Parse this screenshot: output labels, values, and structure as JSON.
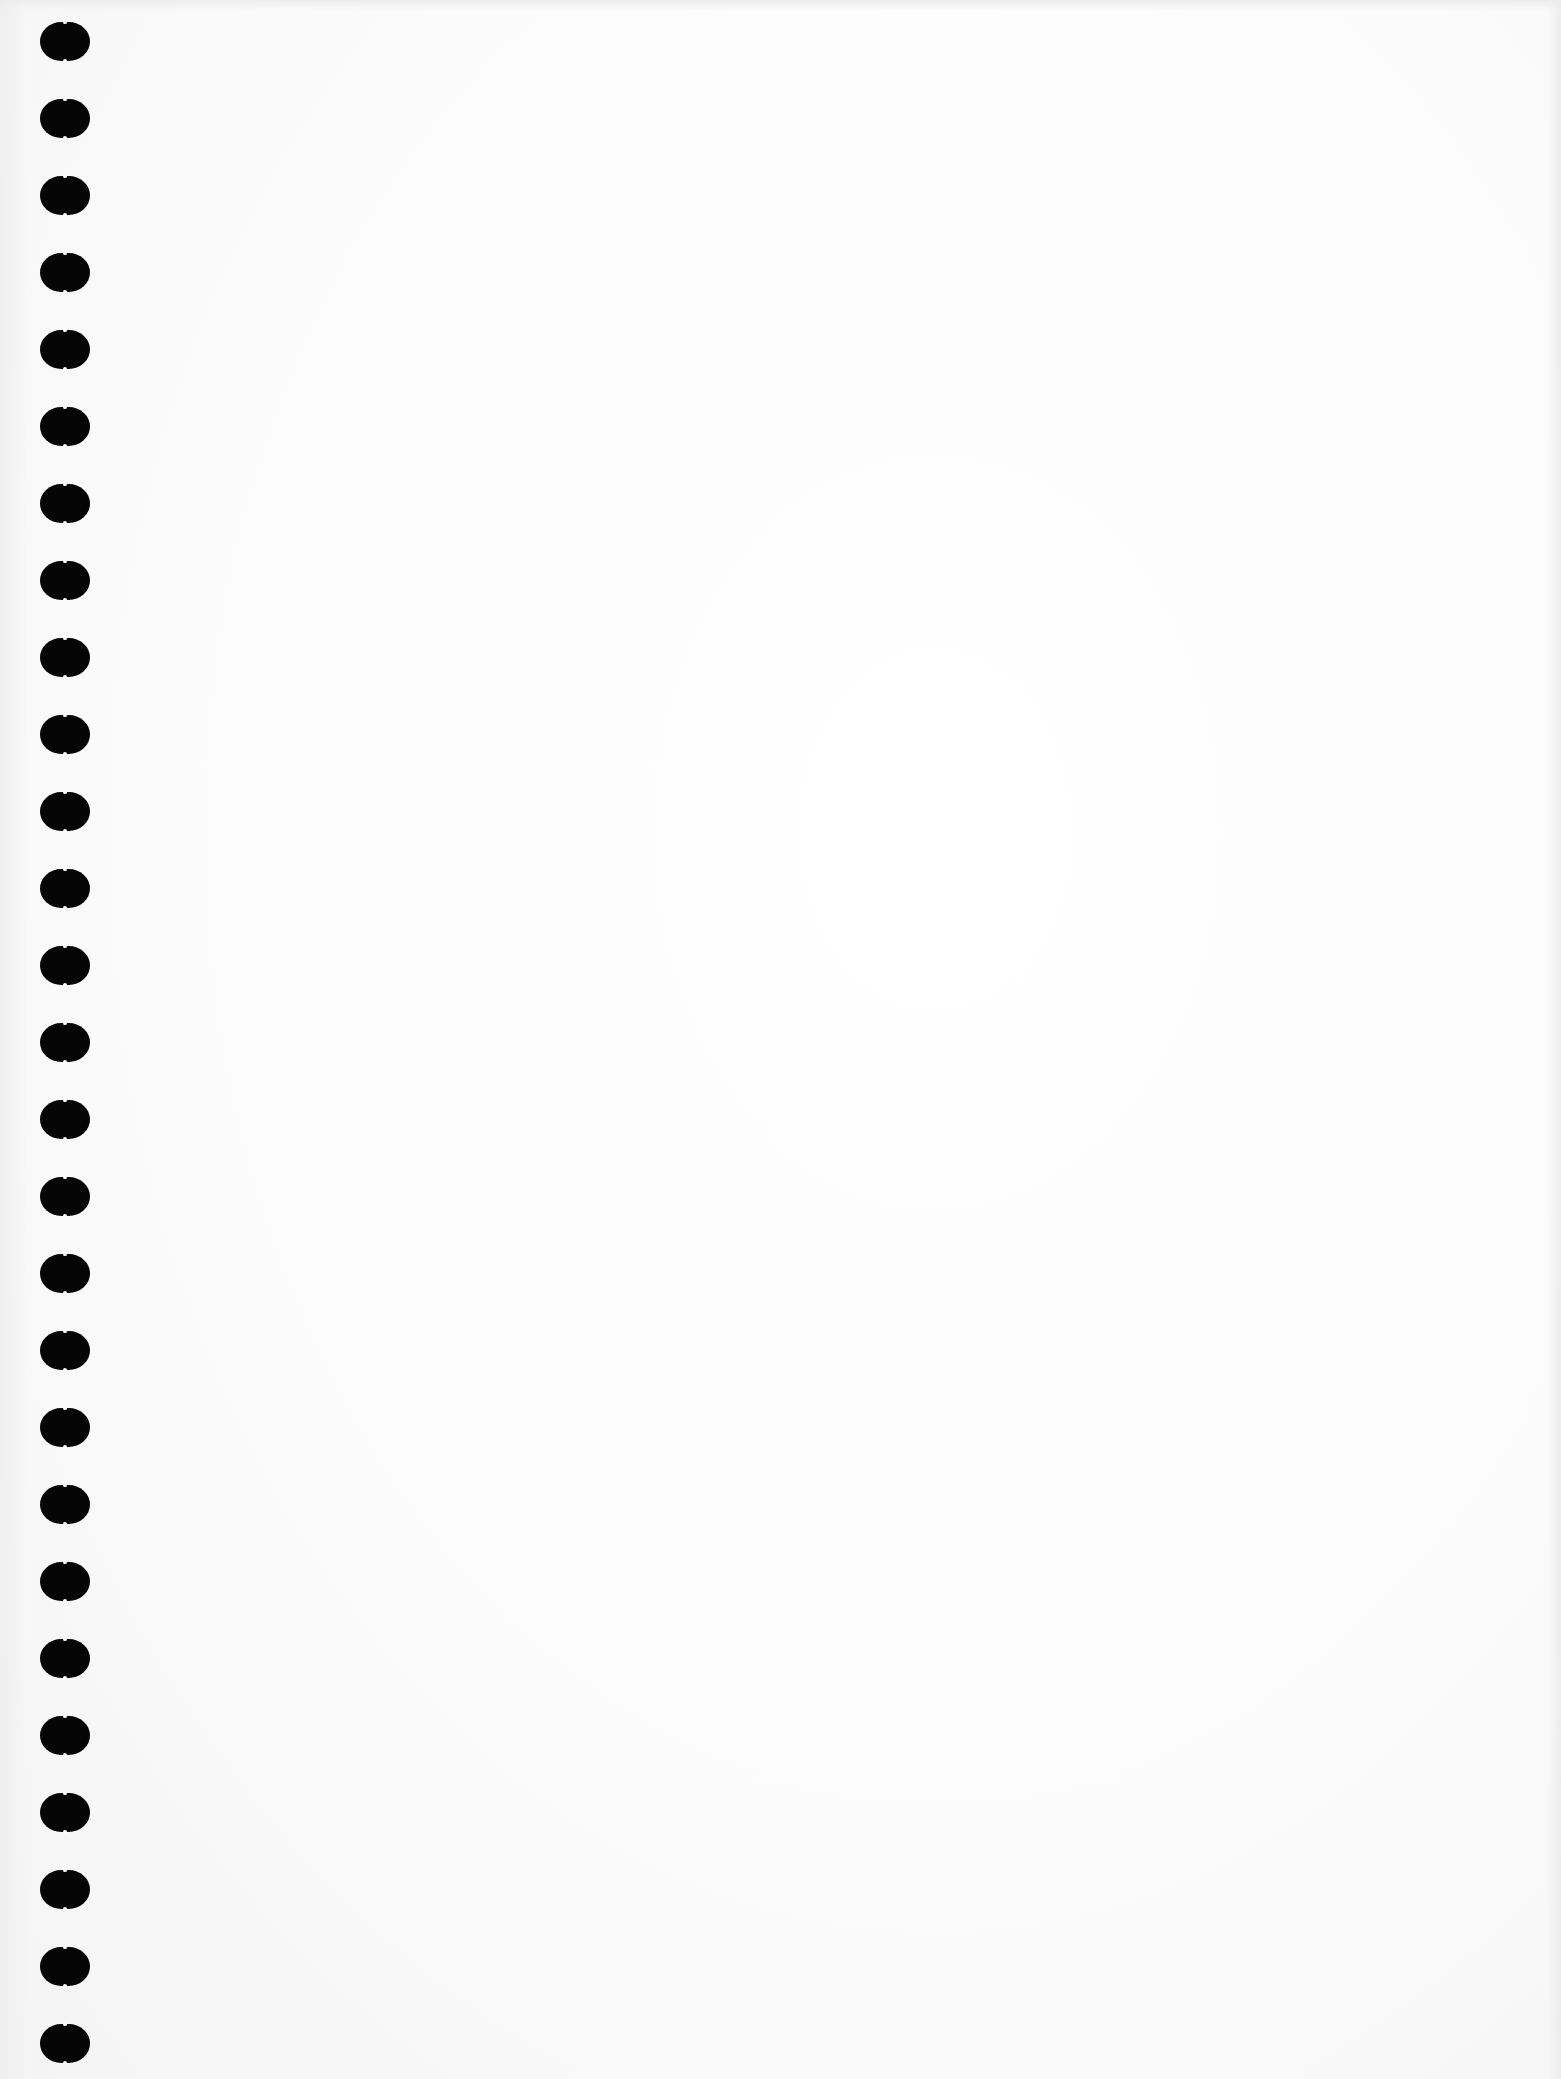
{
  "document": {
    "type": "blank spiral notebook page",
    "paper_color": "#fdfdfd",
    "hole_color": "#050505",
    "content_text": ""
  },
  "binding": {
    "hole_count": 27,
    "first_hole_top": 22,
    "hole_spacing": 77
  }
}
